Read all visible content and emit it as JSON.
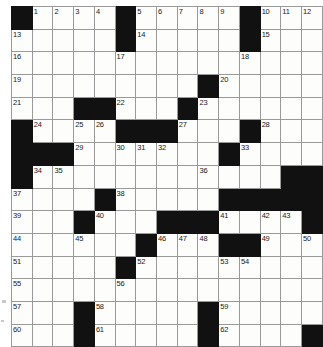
{
  "puzzle": {
    "title": "Crossword Grid",
    "columns": 13,
    "rows": 15,
    "colors": {
      "block": "#111111",
      "cell": "#fdfdfb",
      "grid_line": "#9a9a9a",
      "number_text": "#1a1a1a"
    },
    "highest_clue_number": 62,
    "grid": [
      [
        {
          "block": true,
          "num": ""
        },
        {
          "block": false,
          "num": "1"
        },
        {
          "block": false,
          "num": "2"
        },
        {
          "block": false,
          "num": "3"
        },
        {
          "block": false,
          "num": "4"
        },
        {
          "block": true,
          "num": ""
        },
        {
          "block": false,
          "num": "5"
        },
        {
          "block": false,
          "num": "6"
        },
        {
          "block": false,
          "num": "7"
        },
        {
          "block": false,
          "num": "8"
        },
        {
          "block": false,
          "num": "9"
        },
        {
          "block": true,
          "num": ""
        },
        {
          "block": false,
          "num": "10"
        },
        {
          "block": false,
          "num": "11"
        },
        {
          "block": false,
          "num": "12"
        }
      ],
      [
        {
          "block": false,
          "num": "13"
        },
        {
          "block": false,
          "num": ""
        },
        {
          "block": false,
          "num": ""
        },
        {
          "block": false,
          "num": ""
        },
        {
          "block": false,
          "num": ""
        },
        {
          "block": true,
          "num": ""
        },
        {
          "block": false,
          "num": "14"
        },
        {
          "block": false,
          "num": ""
        },
        {
          "block": false,
          "num": ""
        },
        {
          "block": false,
          "num": ""
        },
        {
          "block": false,
          "num": ""
        },
        {
          "block": true,
          "num": ""
        },
        {
          "block": false,
          "num": "15"
        },
        {
          "block": false,
          "num": ""
        },
        {
          "block": false,
          "num": ""
        }
      ],
      [
        {
          "block": false,
          "num": "16"
        },
        {
          "block": false,
          "num": ""
        },
        {
          "block": false,
          "num": ""
        },
        {
          "block": false,
          "num": ""
        },
        {
          "block": false,
          "num": ""
        },
        {
          "block": false,
          "num": "17"
        },
        {
          "block": false,
          "num": ""
        },
        {
          "block": false,
          "num": ""
        },
        {
          "block": false,
          "num": ""
        },
        {
          "block": false,
          "num": ""
        },
        {
          "block": false,
          "num": ""
        },
        {
          "block": false,
          "num": "18"
        },
        {
          "block": false,
          "num": ""
        },
        {
          "block": false,
          "num": ""
        },
        {
          "block": false,
          "num": ""
        }
      ],
      [
        {
          "block": false,
          "num": "19"
        },
        {
          "block": false,
          "num": ""
        },
        {
          "block": false,
          "num": ""
        },
        {
          "block": false,
          "num": ""
        },
        {
          "block": false,
          "num": ""
        },
        {
          "block": false,
          "num": ""
        },
        {
          "block": false,
          "num": ""
        },
        {
          "block": false,
          "num": ""
        },
        {
          "block": false,
          "num": ""
        },
        {
          "block": true,
          "num": ""
        },
        {
          "block": false,
          "num": "20"
        },
        {
          "block": false,
          "num": ""
        },
        {
          "block": false,
          "num": ""
        },
        {
          "block": false,
          "num": ""
        },
        {
          "block": false,
          "num": ""
        }
      ],
      [
        {
          "block": false,
          "num": "21"
        },
        {
          "block": false,
          "num": ""
        },
        {
          "block": false,
          "num": ""
        },
        {
          "block": true,
          "num": ""
        },
        {
          "block": true,
          "num": ""
        },
        {
          "block": false,
          "num": "22"
        },
        {
          "block": false,
          "num": ""
        },
        {
          "block": false,
          "num": ""
        },
        {
          "block": true,
          "num": ""
        },
        {
          "block": false,
          "num": "23"
        },
        {
          "block": false,
          "num": ""
        },
        {
          "block": false,
          "num": ""
        },
        {
          "block": false,
          "num": ""
        },
        {
          "block": false,
          "num": ""
        },
        {
          "block": false,
          "num": ""
        }
      ],
      [
        {
          "block": true,
          "num": ""
        },
        {
          "block": false,
          "num": "24"
        },
        {
          "block": false,
          "num": ""
        },
        {
          "block": false,
          "num": "25"
        },
        {
          "block": false,
          "num": "26"
        },
        {
          "block": true,
          "num": ""
        },
        {
          "block": true,
          "num": ""
        },
        {
          "block": true,
          "num": ""
        },
        {
          "block": false,
          "num": "27"
        },
        {
          "block": false,
          "num": ""
        },
        {
          "block": false,
          "num": ""
        },
        {
          "block": true,
          "num": ""
        },
        {
          "block": false,
          "num": "28"
        },
        {
          "block": false,
          "num": ""
        },
        {
          "block": false,
          "num": ""
        }
      ],
      [
        {
          "block": true,
          "num": ""
        },
        {
          "block": true,
          "num": ""
        },
        {
          "block": true,
          "num": ""
        },
        {
          "block": false,
          "num": "29"
        },
        {
          "block": false,
          "num": ""
        },
        {
          "block": false,
          "num": "30"
        },
        {
          "block": false,
          "num": "31"
        },
        {
          "block": false,
          "num": "32"
        },
        {
          "block": false,
          "num": ""
        },
        {
          "block": false,
          "num": ""
        },
        {
          "block": true,
          "num": ""
        },
        {
          "block": false,
          "num": "33"
        },
        {
          "block": false,
          "num": ""
        },
        {
          "block": false,
          "num": ""
        },
        {
          "block": false,
          "num": ""
        }
      ],
      [
        {
          "block": true,
          "num": ""
        },
        {
          "block": false,
          "num": "34"
        },
        {
          "block": false,
          "num": "35"
        },
        {
          "block": false,
          "num": ""
        },
        {
          "block": false,
          "num": ""
        },
        {
          "block": false,
          "num": ""
        },
        {
          "block": false,
          "num": ""
        },
        {
          "block": false,
          "num": ""
        },
        {
          "block": false,
          "num": ""
        },
        {
          "block": false,
          "num": "36"
        },
        {
          "block": false,
          "num": ""
        },
        {
          "block": false,
          "num": ""
        },
        {
          "block": false,
          "num": ""
        },
        {
          "block": true,
          "num": ""
        },
        {
          "block": true,
          "num": ""
        }
      ],
      [
        {
          "block": false,
          "num": "37"
        },
        {
          "block": false,
          "num": ""
        },
        {
          "block": false,
          "num": ""
        },
        {
          "block": false,
          "num": ""
        },
        {
          "block": true,
          "num": ""
        },
        {
          "block": false,
          "num": "38"
        },
        {
          "block": false,
          "num": ""
        },
        {
          "block": false,
          "num": ""
        },
        {
          "block": false,
          "num": ""
        },
        {
          "block": false,
          "num": ""
        },
        {
          "block": true,
          "num": ""
        },
        {
          "block": true,
          "num": ""
        },
        {
          "block": true,
          "num": ""
        },
        {
          "block": true,
          "num": ""
        },
        {
          "block": true,
          "num": ""
        }
      ],
      [
        {
          "block": false,
          "num": "39"
        },
        {
          "block": false,
          "num": ""
        },
        {
          "block": false,
          "num": ""
        },
        {
          "block": true,
          "num": ""
        },
        {
          "block": false,
          "num": "40"
        },
        {
          "block": false,
          "num": ""
        },
        {
          "block": false,
          "num": ""
        },
        {
          "block": true,
          "num": ""
        },
        {
          "block": true,
          "num": ""
        },
        {
          "block": true,
          "num": ""
        },
        {
          "block": false,
          "num": "41"
        },
        {
          "block": false,
          "num": ""
        },
        {
          "block": false,
          "num": "42"
        },
        {
          "block": false,
          "num": "43"
        },
        {
          "block": true,
          "num": ""
        }
      ],
      [
        {
          "block": false,
          "num": "44"
        },
        {
          "block": false,
          "num": ""
        },
        {
          "block": false,
          "num": ""
        },
        {
          "block": false,
          "num": "45"
        },
        {
          "block": false,
          "num": ""
        },
        {
          "block": false,
          "num": ""
        },
        {
          "block": true,
          "num": ""
        },
        {
          "block": false,
          "num": "46"
        },
        {
          "block": false,
          "num": "47"
        },
        {
          "block": false,
          "num": "48"
        },
        {
          "block": true,
          "num": ""
        },
        {
          "block": true,
          "num": ""
        },
        {
          "block": false,
          "num": "49"
        },
        {
          "block": false,
          "num": ""
        },
        {
          "block": false,
          "num": "50"
        }
      ],
      [
        {
          "block": false,
          "num": "51"
        },
        {
          "block": false,
          "num": ""
        },
        {
          "block": false,
          "num": ""
        },
        {
          "block": false,
          "num": ""
        },
        {
          "block": false,
          "num": ""
        },
        {
          "block": true,
          "num": ""
        },
        {
          "block": false,
          "num": "52"
        },
        {
          "block": false,
          "num": ""
        },
        {
          "block": false,
          "num": ""
        },
        {
          "block": false,
          "num": ""
        },
        {
          "block": false,
          "num": "53"
        },
        {
          "block": false,
          "num": "54"
        },
        {
          "block": false,
          "num": ""
        },
        {
          "block": false,
          "num": ""
        },
        {
          "block": false,
          "num": ""
        }
      ],
      [
        {
          "block": false,
          "num": "55"
        },
        {
          "block": false,
          "num": ""
        },
        {
          "block": false,
          "num": ""
        },
        {
          "block": false,
          "num": ""
        },
        {
          "block": false,
          "num": ""
        },
        {
          "block": false,
          "num": "56"
        },
        {
          "block": false,
          "num": ""
        },
        {
          "block": false,
          "num": ""
        },
        {
          "block": false,
          "num": ""
        },
        {
          "block": false,
          "num": ""
        },
        {
          "block": false,
          "num": ""
        },
        {
          "block": false,
          "num": ""
        },
        {
          "block": false,
          "num": ""
        },
        {
          "block": false,
          "num": ""
        },
        {
          "block": false,
          "num": ""
        }
      ],
      [
        {
          "block": false,
          "num": "57"
        },
        {
          "block": false,
          "num": ""
        },
        {
          "block": false,
          "num": ""
        },
        {
          "block": true,
          "num": ""
        },
        {
          "block": false,
          "num": "58"
        },
        {
          "block": false,
          "num": ""
        },
        {
          "block": false,
          "num": ""
        },
        {
          "block": false,
          "num": ""
        },
        {
          "block": false,
          "num": ""
        },
        {
          "block": true,
          "num": ""
        },
        {
          "block": false,
          "num": "59"
        },
        {
          "block": false,
          "num": ""
        },
        {
          "block": false,
          "num": ""
        },
        {
          "block": false,
          "num": ""
        },
        {
          "block": false,
          "num": ""
        }
      ],
      [
        {
          "block": false,
          "num": "60"
        },
        {
          "block": false,
          "num": ""
        },
        {
          "block": false,
          "num": ""
        },
        {
          "block": true,
          "num": ""
        },
        {
          "block": false,
          "num": "61"
        },
        {
          "block": false,
          "num": ""
        },
        {
          "block": false,
          "num": ""
        },
        {
          "block": false,
          "num": ""
        },
        {
          "block": false,
          "num": ""
        },
        {
          "block": true,
          "num": ""
        },
        {
          "block": false,
          "num": "62"
        },
        {
          "block": false,
          "num": ""
        },
        {
          "block": false,
          "num": ""
        },
        {
          "block": false,
          "num": ""
        },
        {
          "block": true,
          "num": ""
        }
      ]
    ]
  }
}
